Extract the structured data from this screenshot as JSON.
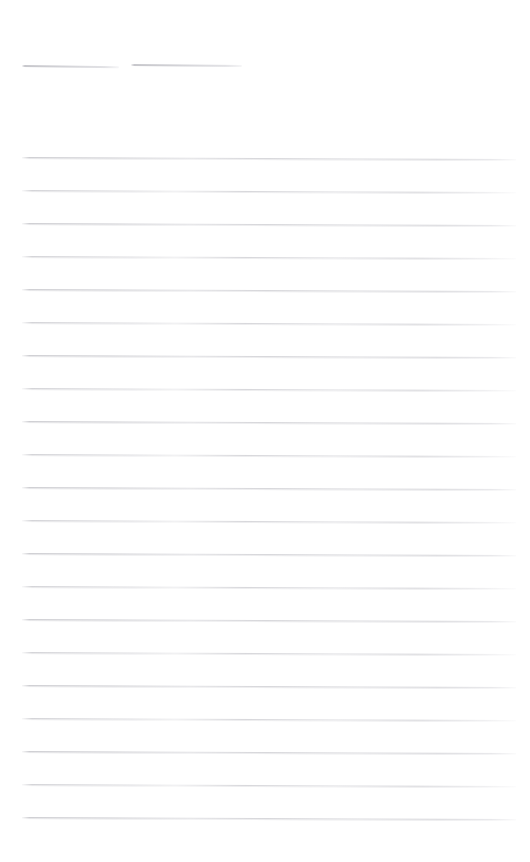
{
  "document": {
    "kind": "blank-lined-form-scan",
    "page_width": 530,
    "page_height": 862,
    "background_color": "#ffffff",
    "rule_color": "#cacace",
    "rule_color_light": "#e2e2e6",
    "title": "",
    "body_text": "",
    "notes": ""
  },
  "header": {
    "title": "",
    "rules": [
      {
        "label": "",
        "x": 22,
        "y": 65,
        "width": 97,
        "slant": 1.2,
        "thickness": 2
      },
      {
        "label": "",
        "x": 131,
        "y": 64,
        "width": 111,
        "slant": 1.0,
        "thickness": 2
      }
    ]
  },
  "body": {
    "text": "",
    "left_margin": 22,
    "right_edge": 516,
    "first_rule_y": 157,
    "rule_spacing": 33,
    "rule_count": 21,
    "rules": [
      {
        "index": 1,
        "y": 157,
        "x": 22,
        "width": 494,
        "slant": 2.0
      },
      {
        "index": 2,
        "y": 190,
        "x": 22,
        "width": 494,
        "slant": 2.0
      },
      {
        "index": 3,
        "y": 223,
        "x": 22,
        "width": 494,
        "slant": 2.0
      },
      {
        "index": 4,
        "y": 256,
        "x": 22,
        "width": 494,
        "slant": 2.0
      },
      {
        "index": 5,
        "y": 289,
        "x": 22,
        "width": 494,
        "slant": 2.0
      },
      {
        "index": 6,
        "y": 322,
        "x": 22,
        "width": 494,
        "slant": 2.0
      },
      {
        "index": 7,
        "y": 355,
        "x": 22,
        "width": 494,
        "slant": 2.0
      },
      {
        "index": 8,
        "y": 388,
        "x": 22,
        "width": 494,
        "slant": 2.0
      },
      {
        "index": 9,
        "y": 421,
        "x": 22,
        "width": 494,
        "slant": 2.0
      },
      {
        "index": 10,
        "y": 454,
        "x": 22,
        "width": 494,
        "slant": 2.0
      },
      {
        "index": 11,
        "y": 487,
        "x": 22,
        "width": 494,
        "slant": 2.0
      },
      {
        "index": 12,
        "y": 520,
        "x": 22,
        "width": 494,
        "slant": 2.0
      },
      {
        "index": 13,
        "y": 553,
        "x": 22,
        "width": 494,
        "slant": 2.0
      },
      {
        "index": 14,
        "y": 586,
        "x": 22,
        "width": 494,
        "slant": 2.0
      },
      {
        "index": 15,
        "y": 619,
        "x": 22,
        "width": 494,
        "slant": 2.0
      },
      {
        "index": 16,
        "y": 652,
        "x": 22,
        "width": 494,
        "slant": 2.0
      },
      {
        "index": 17,
        "y": 685,
        "x": 22,
        "width": 494,
        "slant": 2.0
      },
      {
        "index": 18,
        "y": 718,
        "x": 22,
        "width": 494,
        "slant": 2.0
      },
      {
        "index": 19,
        "y": 751,
        "x": 22,
        "width": 494,
        "slant": 2.0
      },
      {
        "index": 20,
        "y": 784,
        "x": 22,
        "width": 494,
        "slant": 2.0
      },
      {
        "index": 21,
        "y": 817,
        "x": 22,
        "width": 494,
        "slant": 2.0
      }
    ]
  }
}
